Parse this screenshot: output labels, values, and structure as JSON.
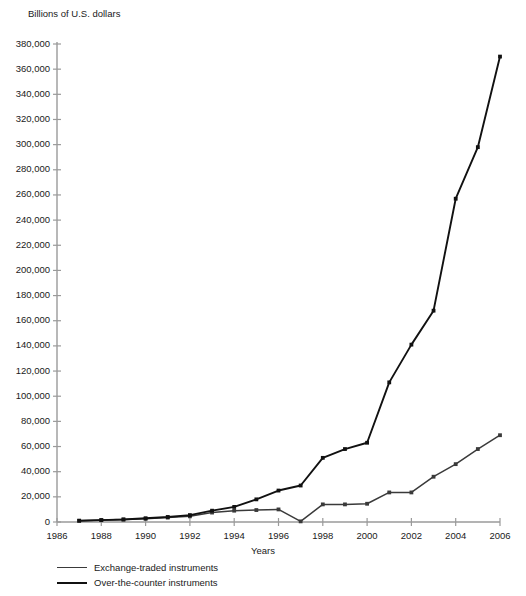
{
  "chart_data": {
    "type": "line",
    "title": "",
    "ylabel": "Billions of U.S. dollars",
    "xlabel": "Years",
    "grid": false,
    "legend_position": "bottom-left",
    "xlim": [
      1986,
      2006
    ],
    "ylim": [
      0,
      380000
    ],
    "x": [
      1987,
      1988,
      1989,
      1990,
      1991,
      1992,
      1993,
      1994,
      1995,
      1996,
      1997,
      1998,
      1999,
      2000,
      2001,
      2002,
      2003,
      2004,
      2005,
      2006
    ],
    "xticks": [
      1986,
      1988,
      1990,
      1992,
      1994,
      1996,
      1998,
      2000,
      2002,
      2004,
      2006
    ],
    "xtick_labels": [
      "1986",
      "1988",
      "1990",
      "1992",
      "1994",
      "1996",
      "1998",
      "2000",
      "2002",
      "2004",
      "2006"
    ],
    "yticks": [
      0,
      20000,
      40000,
      60000,
      80000,
      100000,
      120000,
      140000,
      160000,
      180000,
      200000,
      220000,
      240000,
      260000,
      280000,
      300000,
      320000,
      340000,
      360000,
      380000
    ],
    "ytick_labels": [
      "0",
      "20,000",
      "40,000",
      "60,000",
      "80,000",
      "100,000",
      "120,000",
      "140,000",
      "160,000",
      "180,000",
      "200,000",
      "220,000",
      "240,000",
      "260,000",
      "280,000",
      "300,000",
      "320,000",
      "340,000",
      "360,000",
      "380,000"
    ],
    "series": [
      {
        "name": "Exchange-traded instruments",
        "color": "#3a3a3a",
        "values": [
          1000,
          1500,
          2000,
          2500,
          3500,
          4500,
          7500,
          9000,
          9500,
          10000,
          500,
          14000,
          14000,
          14500,
          23500,
          23500,
          36000,
          46000,
          58000,
          69000
        ]
      },
      {
        "name": "Over-the-counter instruments",
        "color": "#111111",
        "values": [
          1000,
          1500,
          2000,
          3000,
          4000,
          5500,
          9000,
          12000,
          18000,
          25000,
          29000,
          51000,
          58000,
          63000,
          111000,
          141000,
          168000,
          257000,
          298000,
          370000
        ]
      }
    ]
  },
  "legend": {
    "items": [
      {
        "label": "Exchange-traded instruments"
      },
      {
        "label": "Over-the-counter instruments"
      }
    ]
  }
}
